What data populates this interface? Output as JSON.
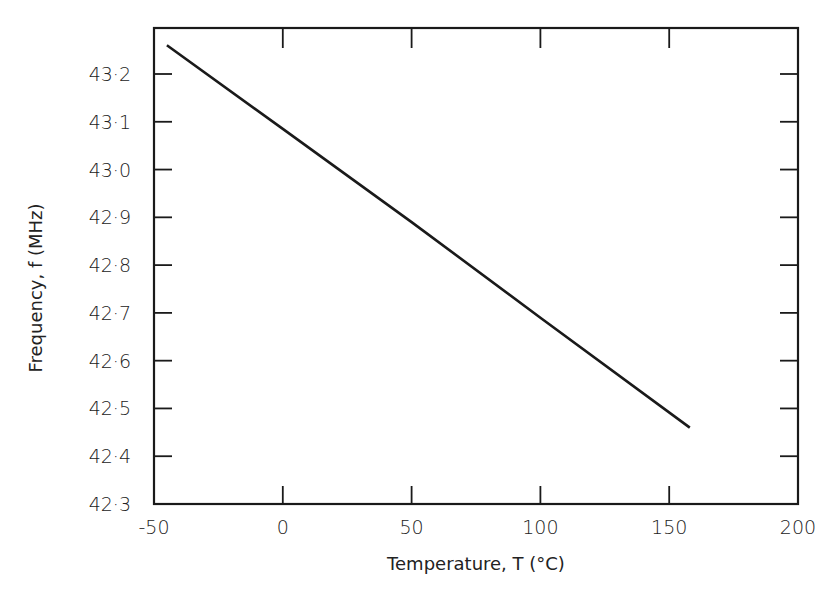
{
  "chart_data": {
    "type": "line",
    "title": "",
    "xlabel": "Temperature, T (°C)",
    "ylabel": "Frequency, f (MHz)",
    "xlim": [
      -50,
      200
    ],
    "ylim": [
      42.3,
      43.3
    ],
    "xticks": [
      -50,
      0,
      50,
      100,
      150,
      200
    ],
    "xtick_labels": [
      "-50",
      "0",
      "50",
      "100",
      "150",
      "200"
    ],
    "yticks": [
      42.3,
      42.4,
      42.5,
      42.6,
      42.7,
      42.8,
      42.9,
      43.0,
      43.1,
      43.2
    ],
    "ytick_labels": [
      "42·3",
      "42·4",
      "42·5",
      "42·6",
      "42·7",
      "42·8",
      "42·9",
      "43·0",
      "43·1",
      "43·2"
    ],
    "grid": false,
    "legend": null,
    "series": [
      {
        "name": "f(T)",
        "x": [
          -45,
          0,
          50,
          100,
          158
        ],
        "y": [
          43.26,
          43.085,
          42.89,
          42.69,
          42.46
        ],
        "color": "#1a1a1a"
      }
    ]
  },
  "frame": {
    "color": "#1a1a1a"
  }
}
